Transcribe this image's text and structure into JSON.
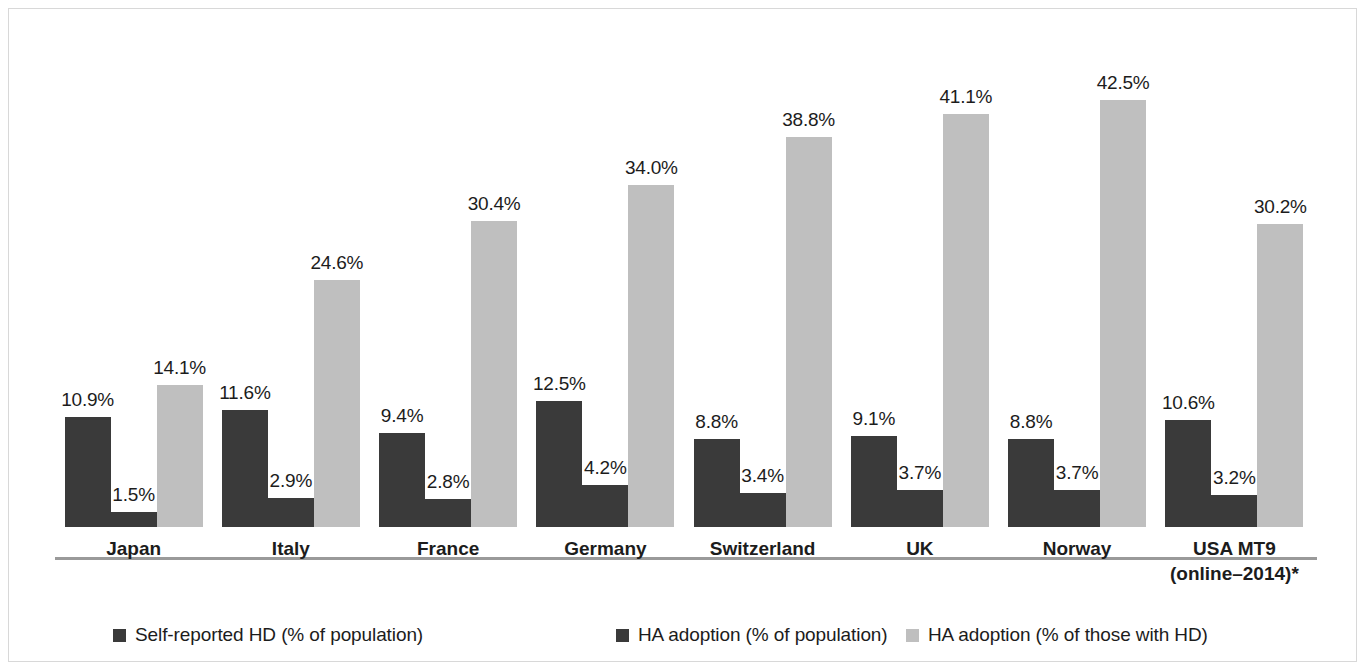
{
  "chart_data": {
    "type": "bar",
    "title": "",
    "subtitle": "",
    "xlabel": "",
    "ylabel": "",
    "ylim": [
      0,
      45
    ],
    "grid": false,
    "legend_position": "bottom",
    "value_suffix": "%",
    "categories": [
      "Japan",
      "Italy",
      "France",
      "Germany",
      "Switzerland",
      "UK",
      "Norway",
      "USA MT9"
    ],
    "category_lines": [
      [
        "Japan"
      ],
      [
        "Italy"
      ],
      [
        "France"
      ],
      [
        "Germany"
      ],
      [
        "Switzerland"
      ],
      [
        "UK"
      ],
      [
        "Norway"
      ],
      [
        "USA MT9",
        "(online–2014)*"
      ]
    ],
    "series": [
      {
        "name": "Self-reported HD (% of population)",
        "color": "#3a3a3a",
        "values": [
          10.9,
          11.6,
          9.4,
          12.5,
          8.8,
          9.1,
          8.8,
          10.6
        ],
        "labels": [
          "10.9%",
          "11.6%",
          "9.4%",
          "12.5%",
          "8.8%",
          "9.1%",
          "8.8%",
          "10.6%"
        ]
      },
      {
        "name": "HA adoption (% of population)",
        "color": "#3a3a3a",
        "values": [
          1.5,
          2.9,
          2.8,
          4.2,
          3.4,
          3.7,
          3.7,
          3.2
        ],
        "labels": [
          "1.5%",
          "2.9%",
          "2.8%",
          "4.2%",
          "3.4%",
          "3.7%",
          "3.7%",
          "3.2%"
        ]
      },
      {
        "name": "HA adoption (% of those with HD)",
        "color": "#bfbfbf",
        "values": [
          14.1,
          24.6,
          30.4,
          34.0,
          38.8,
          41.1,
          42.5,
          30.2
        ],
        "labels": [
          "14.1%",
          "24.6%",
          "30.4%",
          "34.0%",
          "38.8%",
          "41.1%",
          "42.5%",
          "30.2%"
        ]
      }
    ],
    "legend": [
      {
        "label": "Self-reported HD (% of population)",
        "color": "#3a3a3a"
      },
      {
        "label": "HA adoption (% of population)",
        "color": "#3a3a3a"
      },
      {
        "label": "HA adoption (% of those with HD)",
        "color": "#bfbfbf"
      }
    ],
    "footnote_marker": "*",
    "colors": {
      "series_dark": "#3a3a3a",
      "series_light": "#bfbfbf",
      "axis": "#9a9a9a",
      "text": "#1c1c1c",
      "frame": "#d8d8d8",
      "background": "#ffffff"
    }
  }
}
